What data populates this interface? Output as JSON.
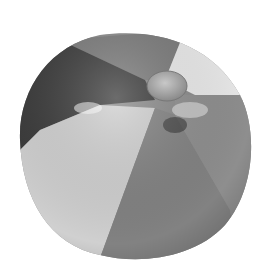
{
  "image": {
    "subject": "beach ball",
    "style": "grayscale photograph",
    "background": "#ffffff",
    "colors": {
      "dark_panel": "#3a3a3a",
      "mid_panel": "#7d7d7d",
      "light_panel": "#d2d2d2",
      "white_panel": "#ececec",
      "valve_cap": "#9a9a9a"
    }
  }
}
